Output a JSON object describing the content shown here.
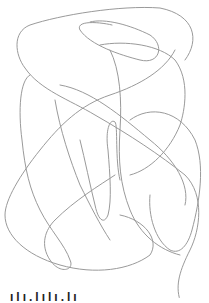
{
  "image": {
    "description": "Hand-drawn continuous gray scribble line sketch on white background",
    "stroke_color": "#9a9a9a",
    "background_color": "#ffffff"
  },
  "caption": {
    "text": "ılı.lılı.lı"
  }
}
